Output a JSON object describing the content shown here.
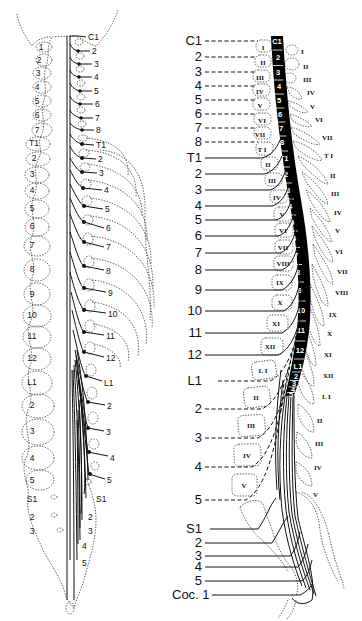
{
  "figure": {
    "left_panel": {
      "title": "Spinal nerve roots relative to vertebrae (posterior view)",
      "left_vertebra_labels": [
        {
          "t": "1",
          "x": 41,
          "y": 47
        },
        {
          "t": "2",
          "x": 39,
          "y": 60
        },
        {
          "t": "3",
          "x": 38,
          "y": 73
        },
        {
          "t": "4",
          "x": 37,
          "y": 87
        },
        {
          "t": "5",
          "x": 37,
          "y": 101
        },
        {
          "t": "6",
          "x": 37,
          "y": 115
        },
        {
          "t": "7",
          "x": 37,
          "y": 130
        },
        {
          "t": "T1",
          "x": 34,
          "y": 143
        },
        {
          "t": "2",
          "x": 34,
          "y": 158
        },
        {
          "t": "3",
          "x": 32,
          "y": 174
        },
        {
          "t": "4",
          "x": 32,
          "y": 190
        },
        {
          "t": "5",
          "x": 32,
          "y": 208
        },
        {
          "t": "6",
          "x": 32,
          "y": 226
        },
        {
          "t": "7",
          "x": 32,
          "y": 245
        },
        {
          "t": "8",
          "x": 32,
          "y": 269
        },
        {
          "t": "9",
          "x": 32,
          "y": 294
        },
        {
          "t": "10",
          "x": 32,
          "y": 315
        },
        {
          "t": "11",
          "x": 32,
          "y": 336
        },
        {
          "t": "12",
          "x": 32,
          "y": 358
        },
        {
          "t": "L1",
          "x": 32,
          "y": 382
        },
        {
          "t": "2",
          "x": 32,
          "y": 405
        },
        {
          "t": "3",
          "x": 32,
          "y": 431
        },
        {
          "t": "4",
          "x": 32,
          "y": 458
        },
        {
          "t": "5",
          "x": 32,
          "y": 480
        },
        {
          "t": "S1",
          "x": 32,
          "y": 499
        },
        {
          "t": "2",
          "x": 32,
          "y": 517
        },
        {
          "t": "3",
          "x": 32,
          "y": 531
        }
      ],
      "right_root_labels": [
        {
          "t": "C1",
          "x": 88,
          "y": 37
        },
        {
          "t": "2",
          "x": 92,
          "y": 51
        },
        {
          "t": "3",
          "x": 94,
          "y": 64
        },
        {
          "t": "4",
          "x": 94,
          "y": 77
        },
        {
          "t": "5",
          "x": 94,
          "y": 91
        },
        {
          "t": "6",
          "x": 95,
          "y": 104
        },
        {
          "t": "7",
          "x": 95,
          "y": 118
        },
        {
          "t": "8",
          "x": 96,
          "y": 130
        },
        {
          "t": "T1",
          "x": 96,
          "y": 145
        },
        {
          "t": "2",
          "x": 98,
          "y": 159
        },
        {
          "t": "3",
          "x": 99,
          "y": 173
        },
        {
          "t": "4",
          "x": 104,
          "y": 190
        },
        {
          "t": "5",
          "x": 105,
          "y": 209
        },
        {
          "t": "6",
          "x": 106,
          "y": 228
        },
        {
          "t": "7",
          "x": 106,
          "y": 247
        },
        {
          "t": "8",
          "x": 106,
          "y": 271
        },
        {
          "t": "9",
          "x": 108,
          "y": 293
        },
        {
          "t": "10",
          "x": 108,
          "y": 314
        },
        {
          "t": "11",
          "x": 106,
          "y": 336
        },
        {
          "t": "12",
          "x": 106,
          "y": 358
        },
        {
          "t": "L1",
          "x": 104,
          "y": 383
        },
        {
          "t": "2",
          "x": 107,
          "y": 406
        },
        {
          "t": "3",
          "x": 106,
          "y": 432
        },
        {
          "t": "4",
          "x": 110,
          "y": 458
        },
        {
          "t": "5",
          "x": 107,
          "y": 480
        },
        {
          "t": "S1",
          "x": 96,
          "y": 499
        },
        {
          "t": "2",
          "x": 88,
          "y": 517
        },
        {
          "t": "3",
          "x": 88,
          "y": 531
        },
        {
          "t": "4",
          "x": 82,
          "y": 546
        },
        {
          "t": "5",
          "x": 82,
          "y": 563
        }
      ]
    },
    "right_panel": {
      "title": "Spinal cord segments relative to vertebral bodies and spinous processes (lateral view)",
      "root_labels": [
        {
          "t": "C1",
          "y": 41
        },
        {
          "t": "2",
          "y": 57
        },
        {
          "t": "3",
          "y": 72
        },
        {
          "t": "4",
          "y": 86
        },
        {
          "t": "5",
          "y": 100
        },
        {
          "t": "6",
          "y": 114
        },
        {
          "t": "7",
          "y": 128
        },
        {
          "t": "8",
          "y": 142
        },
        {
          "t": "T1",
          "y": 158
        },
        {
          "t": "2",
          "y": 174
        },
        {
          "t": "3",
          "y": 190
        },
        {
          "t": "4",
          "y": 206
        },
        {
          "t": "5",
          "y": 220
        },
        {
          "t": "6",
          "y": 236
        },
        {
          "t": "7",
          "y": 253
        },
        {
          "t": "8",
          "y": 270
        },
        {
          "t": "9",
          "y": 290
        },
        {
          "t": "10",
          "y": 311
        },
        {
          "t": "11",
          "y": 333
        },
        {
          "t": "12",
          "y": 355
        },
        {
          "t": "L1",
          "y": 381
        },
        {
          "t": "2",
          "y": 409
        },
        {
          "t": "3",
          "y": 438
        },
        {
          "t": "4",
          "y": 467
        },
        {
          "t": "5",
          "y": 500
        },
        {
          "t": "S1",
          "y": 529
        },
        {
          "t": "2",
          "y": 543
        },
        {
          "t": "3",
          "y": 556
        },
        {
          "t": "4",
          "y": 567
        },
        {
          "t": "5",
          "y": 581
        },
        {
          "t": "Coc. 1",
          "y": 595
        }
      ],
      "cord_segments": [
        "C1",
        "2",
        "3",
        "4",
        "5",
        "6",
        "7",
        "8",
        "T1",
        "2",
        "3",
        "4",
        "5",
        "6",
        "7",
        "8",
        "9",
        "10",
        "11",
        "12",
        "L1",
        "2",
        "3",
        "4",
        "5"
      ],
      "vertebral_body_labels": [
        {
          "t": "I",
          "x": 263,
          "y": 47
        },
        {
          "t": "II",
          "x": 263,
          "y": 62
        },
        {
          "t": "III",
          "x": 260,
          "y": 77
        },
        {
          "t": "IV",
          "x": 260,
          "y": 91
        },
        {
          "t": "V",
          "x": 260,
          "y": 105
        },
        {
          "t": "VI",
          "x": 262,
          "y": 120
        },
        {
          "t": "VII",
          "x": 260,
          "y": 134
        },
        {
          "t": "T I",
          "x": 262,
          "y": 149
        },
        {
          "t": "II",
          "x": 268,
          "y": 164
        },
        {
          "t": "III",
          "x": 272,
          "y": 180
        },
        {
          "t": "IV",
          "x": 277,
          "y": 197
        },
        {
          "t": "V",
          "x": 282,
          "y": 214
        },
        {
          "t": "VI",
          "x": 283,
          "y": 230
        },
        {
          "t": "VII",
          "x": 283,
          "y": 247
        },
        {
          "t": "VIII",
          "x": 283,
          "y": 263
        },
        {
          "t": "IX",
          "x": 280,
          "y": 282
        },
        {
          "t": "X",
          "x": 280,
          "y": 302
        },
        {
          "t": "XI",
          "x": 276,
          "y": 323
        },
        {
          "t": "XII",
          "x": 270,
          "y": 346
        },
        {
          "t": "L I",
          "x": 263,
          "y": 370
        },
        {
          "t": "II",
          "x": 256,
          "y": 397
        },
        {
          "t": "III",
          "x": 251,
          "y": 425
        },
        {
          "t": "IV",
          "x": 247,
          "y": 455
        },
        {
          "t": "V",
          "x": 244,
          "y": 485
        }
      ],
      "spinous_process_labels": [
        {
          "t": "I",
          "x": 301,
          "y": 51
        },
        {
          "t": "II",
          "x": 303,
          "y": 66
        },
        {
          "t": "III",
          "x": 303,
          "y": 79
        },
        {
          "t": "IV",
          "x": 307,
          "y": 92
        },
        {
          "t": "V",
          "x": 310,
          "y": 106
        },
        {
          "t": "VI",
          "x": 315,
          "y": 119
        },
        {
          "t": "VII",
          "x": 322,
          "y": 137
        },
        {
          "t": "T I",
          "x": 324,
          "y": 155
        },
        {
          "t": "II",
          "x": 330,
          "y": 175
        },
        {
          "t": "III",
          "x": 331,
          "y": 193
        },
        {
          "t": "IV",
          "x": 334,
          "y": 212
        },
        {
          "t": "V",
          "x": 335,
          "y": 230
        },
        {
          "t": "VI",
          "x": 335,
          "y": 251
        },
        {
          "t": "VII",
          "x": 337,
          "y": 271
        },
        {
          "t": "VIII",
          "x": 335,
          "y": 292
        },
        {
          "t": "IX",
          "x": 329,
          "y": 314
        },
        {
          "t": "X",
          "x": 327,
          "y": 333
        },
        {
          "t": "XI",
          "x": 324,
          "y": 354
        },
        {
          "t": "XII",
          "x": 323,
          "y": 375
        },
        {
          "t": "L I",
          "x": 322,
          "y": 396
        },
        {
          "t": "II",
          "x": 317,
          "y": 420
        },
        {
          "t": "III",
          "x": 315,
          "y": 443
        },
        {
          "t": "IV",
          "x": 314,
          "y": 467
        },
        {
          "t": "V",
          "x": 313,
          "y": 494
        }
      ]
    }
  },
  "colors": {
    "ink": "#111111",
    "background": "#ffffff",
    "cord_fill": "#000000",
    "segment_text": "#ffffff"
  }
}
